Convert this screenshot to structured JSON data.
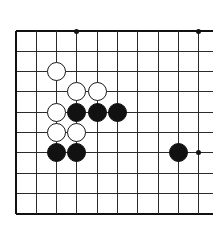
{
  "figure": {
    "kind": "go-board-diagram",
    "background_color": "#ffffff",
    "line_color": "#2b2b2b",
    "edge_color": "#111111",
    "black_stone_color": "#111111",
    "white_stone_color": "#ffffff",
    "white_stone_border_color": "#1a1a1a"
  },
  "board": {
    "columns": 10,
    "rows": 10,
    "origin_x": 16,
    "origin_y": 31,
    "spacing": 20.3,
    "line_overhang_right": 14,
    "stone_radius": 9.6,
    "edges": {
      "left": true,
      "top": true,
      "bottom": true,
      "right": false
    },
    "column_positions": [
      16,
      36.3,
      56.6,
      76.9,
      97.2,
      117.5,
      137.8,
      158.1,
      178.4,
      198.7
    ],
    "row_positions": [
      31,
      51.3,
      71.6,
      91.9,
      112.2,
      132.5,
      152.8,
      173.1,
      193.4,
      213.7
    ]
  },
  "hoshi_points": [
    {
      "col": 3,
      "row": 0,
      "label": "star-point-top"
    },
    {
      "col": 9,
      "row": 0,
      "label": "star-point-top-right"
    },
    {
      "col": 9,
      "row": 6,
      "label": "star-point-right"
    }
  ],
  "stones": [
    {
      "color": "white",
      "col": 2,
      "row": 2,
      "label": "white-stone-c3"
    },
    {
      "color": "white",
      "col": 3,
      "row": 3,
      "label": "white-stone-d4"
    },
    {
      "color": "white",
      "col": 4,
      "row": 3,
      "label": "white-stone-e4"
    },
    {
      "color": "white",
      "col": 2,
      "row": 4,
      "label": "white-stone-c5"
    },
    {
      "color": "black",
      "col": 3,
      "row": 4,
      "label": "black-stone-d5"
    },
    {
      "color": "black",
      "col": 4,
      "row": 4,
      "label": "black-stone-e5"
    },
    {
      "color": "black",
      "col": 5,
      "row": 4,
      "label": "black-stone-f5"
    },
    {
      "color": "white",
      "col": 2,
      "row": 5,
      "label": "white-stone-c6"
    },
    {
      "color": "white",
      "col": 3,
      "row": 5,
      "label": "white-stone-d6"
    },
    {
      "color": "black",
      "col": 2,
      "row": 6,
      "label": "black-stone-c7"
    },
    {
      "color": "black",
      "col": 3,
      "row": 6,
      "label": "black-stone-d7"
    },
    {
      "color": "black",
      "col": 8,
      "row": 6,
      "label": "black-stone-i7"
    }
  ],
  "counts": {
    "black_stones": 6,
    "white_stones": 6,
    "total_stones": 12
  }
}
